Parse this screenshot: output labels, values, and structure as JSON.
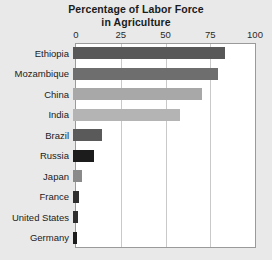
{
  "chart_data": {
    "type": "bar",
    "orientation": "horizontal",
    "title": "Percentage of Labor Force in Agriculture",
    "title_lines": [
      "Percentage of Labor Force",
      "in Agriculture"
    ],
    "xlabel": "",
    "ylabel": "",
    "xlim": [
      0,
      100
    ],
    "xticks": [
      0,
      25,
      50,
      75,
      100
    ],
    "xtick_labels": [
      "0",
      "25",
      "50",
      "75",
      "100"
    ],
    "grid": true,
    "grid_axis": "x",
    "legend": false,
    "categories": [
      "Ethiopia",
      "Mozambique",
      "China",
      "India",
      "Brazil",
      "Russia",
      "Japan",
      "France",
      "United States",
      "Germany"
    ],
    "values": [
      85,
      81,
      72,
      60,
      16,
      12,
      5,
      3.5,
      3,
      2
    ],
    "bar_colors": [
      "#585858",
      "#6e6e6e",
      "#a8a8a8",
      "#b4b4b4",
      "#5a5a5a",
      "#1c1c1c",
      "#8a8a8a",
      "#2e2e2e",
      "#2e2e2e",
      "#1c1c1c"
    ]
  },
  "figure": {
    "background_color": "#e9e9e9",
    "plot_background_color": "#ffffff",
    "plot_border_color": "#9a9a9a",
    "gridline_color": "#c9c9c9",
    "text_color": "#1b1b1b"
  },
  "caption": {
    "text": ""
  }
}
